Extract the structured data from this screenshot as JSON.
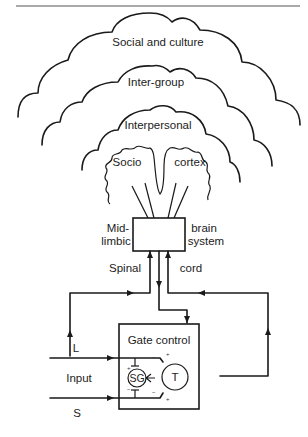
{
  "figure": {
    "type": "gate-control-pain-model-diagram",
    "header_rule": true,
    "colors": {
      "line": "#1a1a1a",
      "text": "#222222",
      "background": "#ffffff"
    }
  },
  "clouds": [
    {
      "id": "social",
      "label": "Social and culture"
    },
    {
      "id": "intergroup",
      "label": "Inter-group"
    },
    {
      "id": "interpersonal",
      "label": "Interpersonal"
    }
  ],
  "cortex": {
    "left_label": "Socio",
    "right_label": "cortex"
  },
  "midbrain": {
    "left_label_1": "Mid-",
    "left_label_2": "limbic",
    "right_label_1": "brain",
    "right_label_2": "system"
  },
  "spinal": {
    "left_label": "Spinal",
    "right_label": "cord"
  },
  "gate": {
    "title": "Gate control",
    "sg_label": "SG",
    "t_label": "T",
    "plus": "+",
    "minus": "−"
  },
  "inputs": {
    "large_fiber": "L",
    "label": "Input",
    "small_fiber": "S"
  }
}
